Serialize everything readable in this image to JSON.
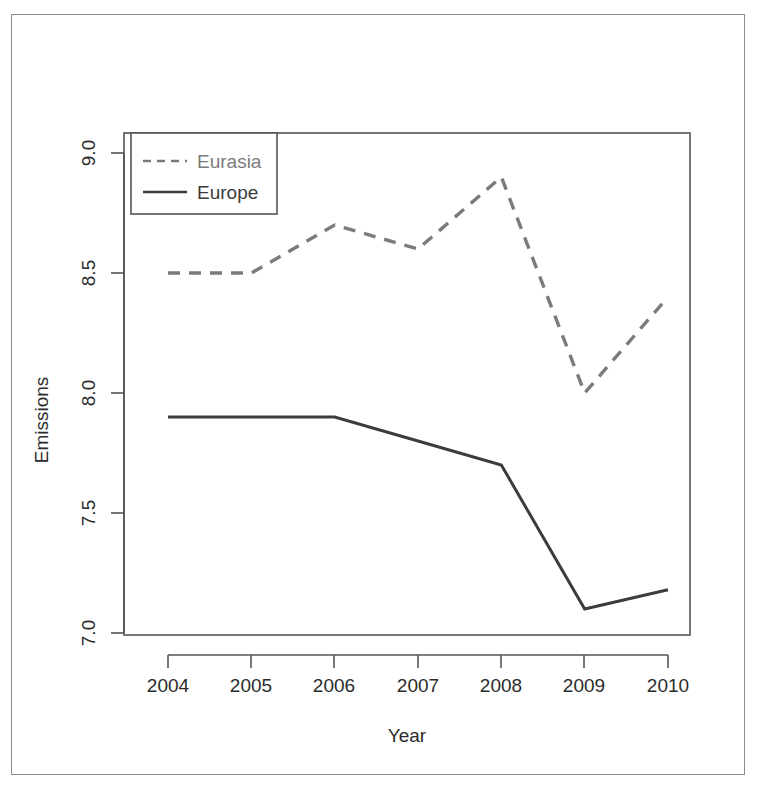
{
  "figure": {
    "background_color": "#ffffff",
    "border_color": "#8d8d8d"
  },
  "axes": {
    "x_title": "Year",
    "y_title": "Emissions",
    "x_tick_labels": [
      "2004",
      "2005",
      "2006",
      "2007",
      "2008",
      "2009",
      "2010"
    ],
    "y_tick_labels": [
      "7.0",
      "7.5",
      "8.0",
      "8.5",
      "9.0"
    ]
  },
  "legend": {
    "entries": [
      {
        "label": "Eurasia",
        "style": "dashed",
        "color": "#7b7b7b"
      },
      {
        "label": "Europe",
        "style": "solid",
        "color": "#3c3c3c"
      }
    ]
  },
  "chart_data": {
    "type": "line",
    "title": "",
    "xlabel": "Year",
    "ylabel": "Emissions",
    "x": [
      2004,
      2005,
      2006,
      2007,
      2008,
      2009,
      2010
    ],
    "xtick_labels": [
      "2004",
      "2005",
      "2006",
      "2007",
      "2008",
      "2009",
      "2010"
    ],
    "ytick_values": [
      7.0,
      7.5,
      8.0,
      8.5,
      9.0
    ],
    "ytick_labels": [
      "7.0",
      "7.5",
      "8.0",
      "8.5",
      "9.0"
    ],
    "xlim": [
      2003.7,
      2010.3
    ],
    "ylim": [
      6.92,
      9.06
    ],
    "grid": false,
    "legend_position": "top-left",
    "series": [
      {
        "name": "Eurasia",
        "style": "dashed",
        "color": "#7b7b7b",
        "values": [
          8.5,
          8.5,
          8.7,
          8.6,
          8.9,
          8.0,
          8.4
        ]
      },
      {
        "name": "Europe",
        "style": "solid",
        "color": "#3c3c3c",
        "values": [
          7.9,
          7.9,
          7.9,
          7.8,
          7.7,
          7.1,
          7.18
        ]
      }
    ]
  }
}
